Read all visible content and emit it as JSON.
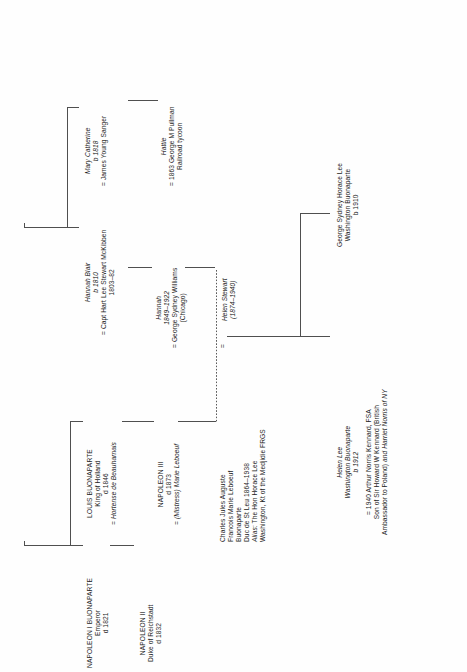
{
  "diagram": {
    "type": "genealogy-family-tree",
    "orientation": "rotated-90-ccw",
    "title_visible": false,
    "line_color": "#4f4f4f",
    "text_color": "#1c1c1c",
    "page_background": "#fefefe"
  },
  "people": {
    "napoleon1": {
      "name": "NAPOLEON I BUONAPARTE",
      "title": "Emperor",
      "death": "d 1821"
    },
    "napoleon2": {
      "name": "NAPOLEON II",
      "title": "Duke of Reichstadt",
      "death": "d 1832"
    },
    "louis": {
      "name": "LOUIS BUONAPARTE",
      "title": "King of Holland",
      "death": "d 1846",
      "spouse": "= Hortense de Beauharnais"
    },
    "napoleon3": {
      "name": "NAPOLEON III",
      "death": "d 1873",
      "spouse": "= (Mistress) Marie Leboeuf"
    },
    "charles": {
      "line1": "Charles Jules Auguste",
      "line2": "Francois Marie Leboeuf",
      "line3": "Buonaparte",
      "line4": "Duc de St Leu 1864–1938",
      "alias_label": "Alias:",
      "alias_rest": " The Hon Horace Lee",
      "line6": "Washington, Kt of the Medjidie FRGS"
    },
    "hannah_blair": {
      "name": "Hannah Blair",
      "birth": "b 1810",
      "spouse": "= Capt Hart Lee Stewart McKibben",
      "spouse_dates": "1803–82"
    },
    "mary_catherine": {
      "name": "Mary Catherine",
      "birth": "b 1818",
      "spouse": "= James Young Sanger"
    },
    "hattie": {
      "name": "Hattie",
      "spouse": "= 1863 George M Pullman",
      "note": "Railroad tycoon"
    },
    "hannah_williams": {
      "name": "Hannah",
      "dates": "1849–1922",
      "spouse": "= George Sydney Williams",
      "place": "(Chicago)"
    },
    "helen_stewart": {
      "name": "Helen Stewart",
      "dates": "(1874–1940)"
    },
    "helen_lee": {
      "name": "Helen Lee",
      "surname": "Washington Buonaparte",
      "birth": "b 1912",
      "spouse": "= 1940 Arthur Norris Kennard, FSA",
      "spouse_note1": "Son of Sir Howard W Kennard (British",
      "spouse_note2a": "Ambassador to Poland) ",
      "spouse_note2b": "and Harriet Norris of NY"
    },
    "george_sydney": {
      "line1": "George Sydney Horace Lee",
      "line2": "Washington Buonaparte",
      "birth": "b 1910"
    }
  },
  "marriage_symbol": "=",
  "links": {
    "napoleon1_to_louis": "sibling-bracket",
    "napoleon3_to_charles": "descent",
    "charles_to_helen_stewart": "dotted-marriage",
    "helen_stewart_children": [
      "helen_lee",
      "george_sydney"
    ]
  }
}
